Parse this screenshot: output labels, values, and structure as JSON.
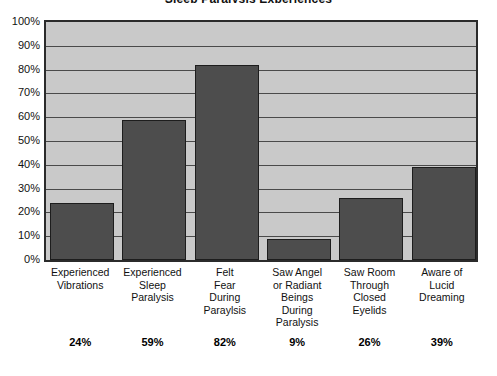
{
  "chart_data": {
    "type": "bar",
    "title": "Sleep Paralysis Experiences",
    "xlabel": "",
    "ylabel": "",
    "ylim": [
      0,
      100
    ],
    "grid": true,
    "legend": "none",
    "categories": [
      "Experienced Vibrations",
      "Experienced Sleep Paralysis",
      "Felt Fear During Paraylsis",
      "Saw Angel or Radiant Beings During Paralysis",
      "Saw Room Through Closed Eyelids",
      "Aware of Lucid Dreaming"
    ],
    "category_lines": [
      [
        "Experienced",
        "Vibrations"
      ],
      [
        "Experienced",
        "Sleep",
        "Paralysis"
      ],
      [
        "Felt",
        "Fear",
        "During",
        "Paraylsis"
      ],
      [
        "Saw Angel",
        "or Radiant",
        "Beings",
        "During",
        "Paralysis"
      ],
      [
        "Saw Room",
        "Through",
        "Closed",
        "Eyelids"
      ],
      [
        "Aware of",
        "Lucid",
        "Dreaming"
      ]
    ],
    "values": [
      24,
      59,
      82,
      9,
      26,
      39
    ],
    "value_labels": [
      "24%",
      "59%",
      "82%",
      "9%",
      "26%",
      "39%"
    ],
    "y_ticks": [
      0,
      10,
      20,
      30,
      40,
      50,
      60,
      70,
      80,
      90,
      100
    ],
    "y_tick_labels": [
      "0%",
      "10%",
      "20%",
      "30%",
      "40%",
      "50%",
      "60%",
      "70%",
      "80%",
      "90%",
      "100%"
    ],
    "colors": {
      "bar_fill": "#4d4d4d",
      "bar_stroke": "#1d1d1d",
      "plot_background": "#c9c9c9",
      "gridline": "#4a4a4a",
      "frame": "#2b2b2b",
      "page_background": "#ffffff",
      "text": "#111111"
    }
  }
}
